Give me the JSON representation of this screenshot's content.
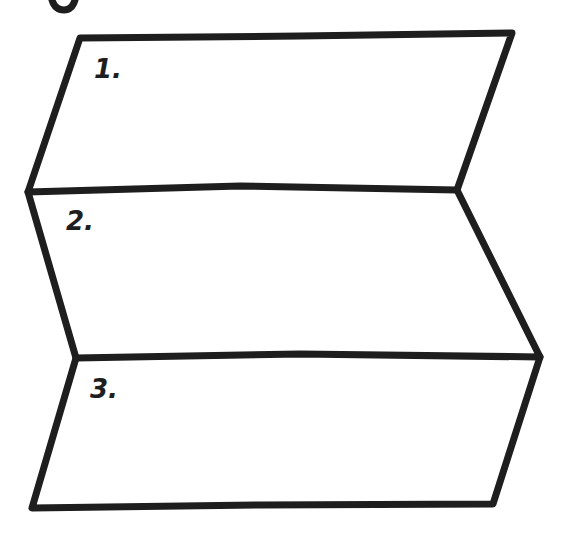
{
  "diagram": {
    "stroke_color": "#1e1e1e",
    "background": "#ffffff",
    "panels": [
      {
        "label": "1."
      },
      {
        "label": "2."
      },
      {
        "label": "3."
      }
    ],
    "partial_glyph_top": "g"
  }
}
